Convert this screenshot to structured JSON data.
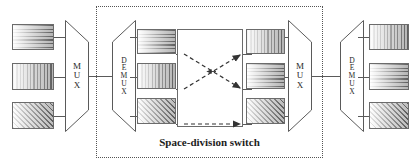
{
  "diagram": {
    "title": "Space-division switch",
    "caption": "Space-division switch",
    "enclosure_label": "Space-division switch"
  },
  "labels": {
    "mux": "MUX",
    "demux": "DEMUX",
    "mux_letters": [
      "M",
      "U",
      "X"
    ],
    "demux_letters": [
      "D",
      "E",
      "M",
      "U",
      "X"
    ]
  },
  "nodes": {
    "input_mux": {
      "label": "MUX",
      "role": "multiplexer"
    },
    "switch_demux": {
      "label": "DEMUX",
      "role": "demultiplexer"
    },
    "switch_mux": {
      "label": "MUX",
      "role": "multiplexer"
    },
    "output_demux": {
      "label": "DEMUX",
      "role": "demultiplexer"
    }
  },
  "channels": {
    "input_blocks": [
      {
        "pattern": "horizontal",
        "index": 1
      },
      {
        "pattern": "vertical",
        "index": 2
      },
      {
        "pattern": "diagonal",
        "index": 3
      }
    ],
    "switch_input_blocks": [
      {
        "pattern": "horizontal",
        "index": 1
      },
      {
        "pattern": "vertical",
        "index": 2
      },
      {
        "pattern": "diagonal",
        "index": 3
      }
    ],
    "switch_output_blocks": [
      {
        "pattern": "vertical",
        "index": 1
      },
      {
        "pattern": "horizontal",
        "index": 2
      },
      {
        "pattern": "diagonal",
        "index": 3
      }
    ],
    "output_blocks": [
      {
        "pattern": "vertical",
        "index": 1
      },
      {
        "pattern": "horizontal",
        "index": 2
      },
      {
        "pattern": "diagonal",
        "index": 3
      }
    ]
  },
  "routing": [
    {
      "from": 1,
      "to": 2,
      "style": "dashed-arrow"
    },
    {
      "from": 2,
      "to": 1,
      "style": "dashed-arrow"
    },
    {
      "from": 3,
      "to": 3,
      "style": "dashed-arrow"
    }
  ],
  "colors": {
    "line": "#5a5a5a",
    "border": "#6b6b6b",
    "dotted_border": "#555555",
    "text": "#1c1c1c",
    "background": "#ffffff",
    "hatch": "#3c3c3c"
  }
}
